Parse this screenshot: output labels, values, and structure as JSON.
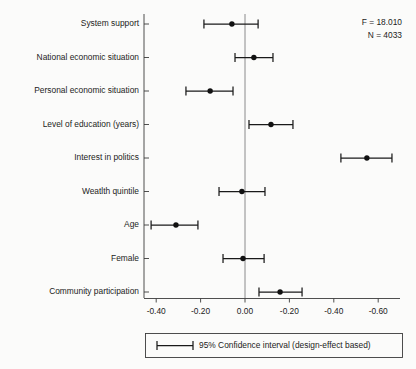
{
  "chart_data": {
    "type": "scatter",
    "title": "",
    "subtitle": "",
    "xlabel": "",
    "ylabel": "",
    "orientation": "horizontal",
    "grid": false,
    "zero_reference_line": true,
    "xlim": [
      -0.5,
      0.72
    ],
    "x_tick_labels": [
      "-0.40",
      "-0.20",
      "0.00",
      "-0.20",
      "-0.40",
      "-0.60"
    ],
    "x_tick_values": [
      -0.4,
      -0.2,
      0.0,
      0.2,
      0.4,
      0.6
    ],
    "categories": [
      "System support",
      "National economic situation",
      "Personal economic situation",
      "Level of education (years)",
      "Interest in politics",
      "Weatlth quintile",
      "Age",
      "Female",
      "Community participation"
    ],
    "point_estimates": [
      -0.059,
      0.04,
      -0.157,
      0.117,
      0.549,
      -0.014,
      -0.311,
      -0.009,
      0.158
    ],
    "ci_low": [
      -0.185,
      -0.045,
      -0.266,
      0.018,
      0.432,
      -0.117,
      -0.423,
      -0.099,
      0.063
    ],
    "ci_high": [
      0.059,
      0.126,
      -0.054,
      0.216,
      0.662,
      0.09,
      -0.212,
      0.086,
      0.257
    ],
    "series_name": "95% Confidence interval (design-effect based)",
    "annotations": [
      {
        "name": "f-statistic",
        "text": "F = 18.010"
      },
      {
        "name": "sample-size",
        "text": "N = 4033"
      }
    ],
    "legend": {
      "position": "bottom",
      "entries": [
        {
          "label": "95% Confidence interval (design-effect based)",
          "marker": "errorbar"
        }
      ]
    },
    "colors": {
      "point": "#111111",
      "interval": "#1a1a1a",
      "axis": "#3b3b3b",
      "zero_line": "#6e6e6e",
      "background": "#fbfbfa"
    }
  }
}
